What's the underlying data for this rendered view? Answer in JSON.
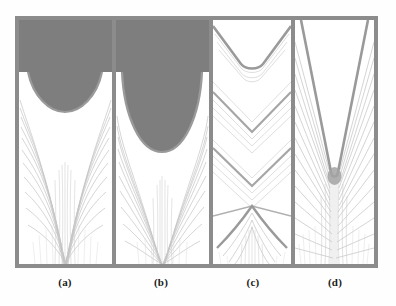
{
  "figure": {
    "kind": "micrograph-montage",
    "panel_count": 4,
    "frame_color": "#8c8c8c",
    "background_color": "#ffffff",
    "top_band_color": "#7e7e7e",
    "grain_color": "#b9b9b9",
    "boundary_color": "#9a9a9a"
  },
  "captions": {
    "a": "(a)",
    "b": "(b)",
    "c": "(c)",
    "d": "(d)"
  },
  "panels": [
    {
      "id": "a",
      "label": "(a)",
      "top_band": true,
      "top_band_height_pct": 21,
      "pool_shape": "shallow-wide-U",
      "pool_width_pct": 78,
      "pool_depth_pct": 18,
      "grain_pattern": "radial-fan-curved",
      "grain_line_count": 26
    },
    {
      "id": "b",
      "label": "(b)",
      "top_band": true,
      "top_band_height_pct": 21,
      "pool_shape": "deep-narrow-U",
      "pool_width_pct": 80,
      "pool_depth_pct": 34,
      "grain_pattern": "radial-fan-curved",
      "grain_line_count": 24
    },
    {
      "id": "c",
      "label": "(c)",
      "top_band": false,
      "top_band_height_pct": 0,
      "pool_shape": "stacked-chevrons",
      "pool_width_pct": 95,
      "pool_depth_pct": 22,
      "grain_pattern": "chevron-bands",
      "grain_line_count": 22,
      "chevron_band_count": 5
    },
    {
      "id": "d",
      "label": "(d)",
      "top_band": false,
      "top_band_height_pct": 0,
      "pool_shape": "deep-narrow-V-keyhole",
      "pool_width_pct": 80,
      "pool_depth_pct": 62,
      "grain_pattern": "herringbone-dense",
      "grain_line_count": 34
    }
  ]
}
